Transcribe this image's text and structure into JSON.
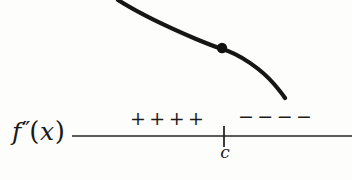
{
  "figure": {
    "background_color": "#fdfdfc",
    "ink_color": "#1a1a1a"
  },
  "function_label": {
    "base": "f",
    "primes": "″",
    "open_paren": "(",
    "variable": "x",
    "close_paren": ")",
    "full": "f″(x)"
  },
  "number_line": {
    "y": 136,
    "x_start": 72,
    "x_end": 352,
    "stroke": "#252525",
    "stroke_width": 1.6
  },
  "tick": {
    "label": "c",
    "x": 224,
    "y_top": 126,
    "y_bottom": 147,
    "stroke": "#252525",
    "stroke_width": 1.8
  },
  "sign_intervals": [
    {
      "name": "left-of-c",
      "sign": "+",
      "glyphs": [
        "+",
        "+",
        "+",
        "+"
      ],
      "count": 4,
      "meaning": "concave up"
    },
    {
      "name": "right-of-c",
      "sign": "−",
      "glyphs": [
        "−",
        "−",
        "−",
        "−"
      ],
      "count": 4,
      "meaning": "concave down"
    }
  ],
  "curve": {
    "stroke": "#161616",
    "stroke_width": 4.2,
    "path": "M 118 0 C 140 14, 170 28, 196 39 C 208 44, 216 47, 222 49 C 240 54, 262 70, 274 84 C 280 91, 283 95, 285 98",
    "start_point": [
      118,
      0
    ],
    "end_point": [
      285,
      98
    ],
    "description": "decreasing curve, concave up then concave down"
  },
  "inflection_point": {
    "label": "inflection point at c",
    "x": 222,
    "y": 48,
    "radius": 5.2,
    "fill": "#111111"
  }
}
